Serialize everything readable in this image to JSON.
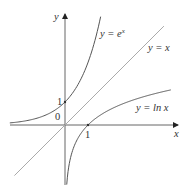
{
  "chart_data": {
    "type": "line",
    "title": "",
    "xlabel": "x",
    "ylabel": "y",
    "xlim": [
      -2.4,
      4.9
    ],
    "ylim": [
      -2.6,
      4.9
    ],
    "grid": false,
    "legend": "inline labels",
    "origin_label": "0",
    "tick_labels": {
      "x": [
        "1"
      ],
      "y": [
        "1"
      ]
    },
    "series": [
      {
        "name": "y = e^x",
        "label_main": "y = e",
        "label_sup": "x",
        "function": "exp(x)",
        "color": "#555555",
        "points": [
          [
            -2.4,
            0.09
          ],
          [
            -1,
            0.37
          ],
          [
            0,
            1
          ],
          [
            1,
            2.72
          ],
          [
            1.5,
            4.48
          ],
          [
            1.59,
            4.9
          ]
        ]
      },
      {
        "name": "y = x",
        "label": "y = x",
        "function": "x",
        "color": "#aaaaaa",
        "points": [
          [
            -2.2,
            -2.2
          ],
          [
            4.3,
            4.3
          ]
        ]
      },
      {
        "name": "y = ln x",
        "label": "y = ln x",
        "function": "ln(x)",
        "color": "#555555",
        "points": [
          [
            0.07,
            -2.6
          ],
          [
            0.37,
            -1
          ],
          [
            1,
            0
          ],
          [
            2.72,
            1
          ],
          [
            4.6,
            1.53
          ]
        ]
      }
    ]
  },
  "scale": {
    "origin_px": [
      65,
      125
    ],
    "unit_px": 23
  }
}
